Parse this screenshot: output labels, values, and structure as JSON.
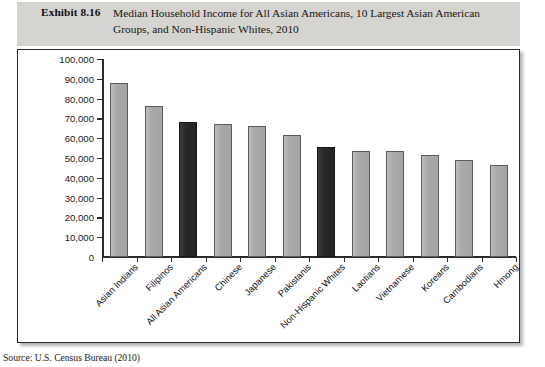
{
  "header": {
    "exhibit_label": "Exhibit 8.16",
    "caption": "Median Household Income for All Asian Americans, 10 Largest Asian American Groups, and Non-Hispanic Whites, 2010"
  },
  "source": "Source: U.S. Census Bureau (2010)",
  "colors": {
    "bar_light": "#a9a9a9",
    "bar_dark": "#262626",
    "caption_band": "#d6d4d1",
    "frame_border": "#2b2b2b"
  },
  "chart_data": {
    "type": "bar",
    "title": "Median Household Income for All Asian Americans, 10 Largest Asian American Groups, and Non-Hispanic Whites, 2010",
    "xlabel": "",
    "ylabel": "",
    "ylim": [
      0,
      100000
    ],
    "yticks": [
      "0",
      "10,000",
      "20,000",
      "30,000",
      "40,000",
      "50,000",
      "60,000",
      "70,000",
      "80,000",
      "90,000",
      "100,000"
    ],
    "ytick_values": [
      0,
      10000,
      20000,
      30000,
      40000,
      50000,
      60000,
      70000,
      80000,
      90000,
      100000
    ],
    "grid": false,
    "legend": "none",
    "categories": [
      "Asian Indians",
      "Filipinos",
      "All Asian Americans",
      "Chinese",
      "Japanese",
      "Pakistanis",
      "Non-Hispanic Whites",
      "Laotians",
      "Vietnamese",
      "Koreans",
      "Cambodians",
      "Hmong"
    ],
    "values": [
      88000,
      76500,
      68000,
      67000,
      66000,
      61500,
      55500,
      53500,
      53500,
      51500,
      49000,
      46500
    ],
    "highlight": [
      false,
      false,
      true,
      false,
      false,
      false,
      true,
      false,
      false,
      false,
      false,
      false
    ]
  }
}
